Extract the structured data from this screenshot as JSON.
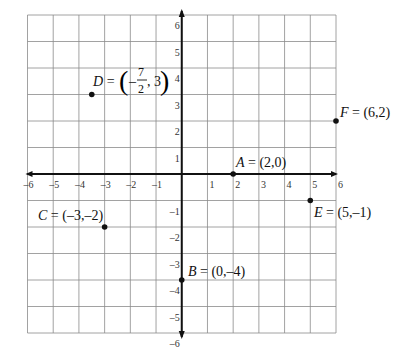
{
  "chart_data": {
    "type": "scatter",
    "title": "",
    "xlabel": "",
    "ylabel": "",
    "xlim": [
      -6,
      6
    ],
    "ylim": [
      -6,
      6
    ],
    "grid": true,
    "x_ticks": [
      -6,
      -5,
      -4,
      -3,
      -2,
      -1,
      1,
      2,
      3,
      4,
      5,
      6
    ],
    "y_ticks": [
      6,
      5,
      4,
      3,
      2,
      1,
      -1,
      -2,
      -3,
      -4,
      -5,
      -6
    ],
    "x_tick_labels": [
      "-6",
      "-5",
      "-4",
      "-3",
      "-2",
      "-1",
      "1",
      "2",
      "3",
      "4",
      "5",
      "6"
    ],
    "y_tick_labels": [
      "6",
      "5",
      "4",
      "3",
      "2",
      "1",
      "-1",
      "-2",
      "-3",
      "-4",
      "-5",
      "-6"
    ],
    "points": [
      {
        "name": "A",
        "x": 2,
        "y": 0,
        "label": "A = (2,0)"
      },
      {
        "name": "B",
        "x": 0,
        "y": -4,
        "label": "B = (0,-4)"
      },
      {
        "name": "C",
        "x": -3,
        "y": -2,
        "label": "C = (-3,-2)"
      },
      {
        "name": "D",
        "x": -3.5,
        "y": 3,
        "label": "D = (-7/2, 3)"
      },
      {
        "name": "E",
        "x": 5,
        "y": -1,
        "label": "E = (5,-1)"
      },
      {
        "name": "F",
        "x": 6,
        "y": 2,
        "label": "F = (6,2)"
      }
    ]
  },
  "labels": {
    "A": {
      "letter": "A",
      "rest": " = (2,0)"
    },
    "B": {
      "letter": "B",
      "rest": " = (0,–4)"
    },
    "C": {
      "letter": "C",
      "rest": " = (–3,–2)"
    },
    "D": {
      "letter": "D",
      "eq": " =",
      "minus": "–",
      "num": "7",
      "den": "2",
      "tail": ", 3"
    },
    "E": {
      "letter": "E",
      "rest": " = (5,–1)"
    },
    "F": {
      "letter": "F",
      "rest": " = (6,2)"
    }
  },
  "colors": {
    "grid": "#8a8a8a",
    "axis": "#111111",
    "point": "#111111",
    "background": "#ffffff"
  }
}
